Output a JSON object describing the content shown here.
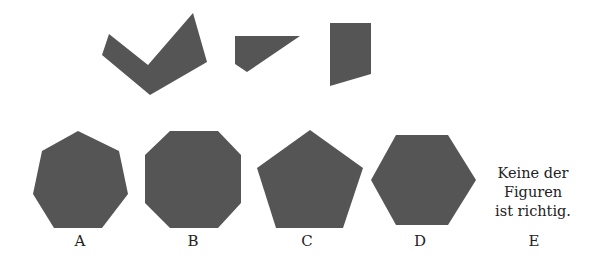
{
  "question": {
    "pieces": [
      {
        "name": "chevron-piece",
        "points": "109,34 148,65 193,13 207,62 150,95 102,55"
      },
      {
        "name": "wedge-piece",
        "points": "235,36 300,36 247,72 235,64"
      },
      {
        "name": "quad-piece",
        "points": "330,23 371,23 371,74 330,86"
      }
    ],
    "fill_color": "#555555"
  },
  "options": [
    {
      "letter": "A",
      "shape": "heptagon",
      "points": "78,131 119,151 128,194 102,228 54,228 33,194 42,151"
    },
    {
      "letter": "B",
      "shape": "octagon",
      "points": "170,131 218,131 241,155 241,203 218,228 170,228 145,203 145,155"
    },
    {
      "letter": "C",
      "shape": "pentagon",
      "points": "310,130 363,168 343,228 276,228 257,168"
    },
    {
      "letter": "D",
      "shape": "hexagon",
      "points": "396,135 448,135 476,180 448,225 396,225 371,180"
    },
    {
      "letter": "E",
      "text_lines": [
        "Keine der",
        "Figuren",
        "ist richtig."
      ]
    }
  ]
}
